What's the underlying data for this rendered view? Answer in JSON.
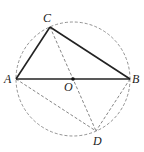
{
  "diagram": {
    "title": "",
    "circle": {
      "center": "O",
      "cx": 73,
      "cy": 79,
      "r": 57,
      "style": "dashed"
    },
    "points": {
      "A": {
        "label": "A",
        "x": 16,
        "y": 79
      },
      "B": {
        "label": "B",
        "x": 130,
        "y": 79
      },
      "C": {
        "label": "C",
        "x": 50,
        "y": 27
      },
      "D": {
        "label": "D",
        "x": 96,
        "y": 131
      },
      "O": {
        "label": "O",
        "x": 73,
        "y": 79
      }
    },
    "solid_segments": [
      "AC",
      "CB",
      "AB"
    ],
    "dashed_segments": [
      "CD",
      "AD",
      "BD"
    ],
    "colors": {
      "stroke": "#222222",
      "dashed": "#666666",
      "background": "#ffffff"
    }
  }
}
